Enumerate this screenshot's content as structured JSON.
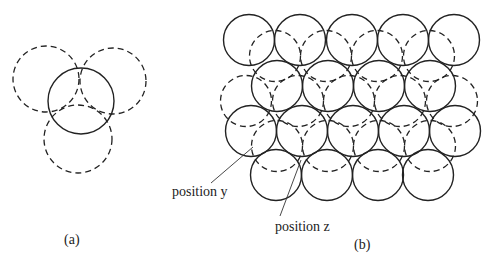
{
  "figure": {
    "panel_a": {
      "caption": "(a)",
      "description": "One solid sphere with three dashed spheres from adjacent layer around it",
      "solid_circles": 1,
      "dashed_circles": 3
    },
    "panel_b": {
      "caption": "(b)",
      "description": "Close-packed layer of solid spheres with dashed second-layer spheres over hollows",
      "rows_of_solid_circles": [
        5,
        4,
        5,
        4
      ],
      "labels": {
        "position_y": "position y",
        "position_z": "position z"
      }
    }
  }
}
